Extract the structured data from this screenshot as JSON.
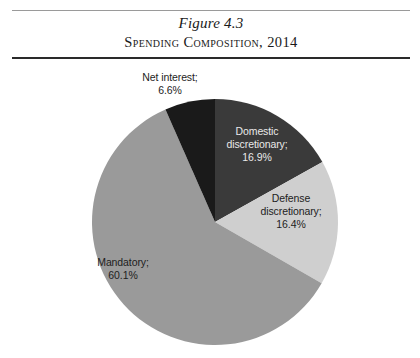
{
  "caption": {
    "figure_number": "Figure 4.3",
    "title": "Spending Composition, 2014"
  },
  "chart_data": {
    "type": "pie",
    "title": "Spending Composition, 2014",
    "xlabel": "",
    "ylabel": "",
    "legend_position": "none",
    "grid": false,
    "start_angle_deg": 0,
    "direction": "clockwise",
    "units": "percent",
    "total": 100.0,
    "categories": [
      "Domestic discretionary",
      "Defense discretionary",
      "Mandatory",
      "Net interest"
    ],
    "values": [
      16.9,
      16.4,
      60.1,
      6.6
    ],
    "colors": [
      "#3a3a3a",
      "#cfcfcf",
      "#9a9a9a",
      "#1a1a1a"
    ],
    "slices": [
      {
        "name": "Domestic discretionary",
        "value": 16.9,
        "label": "Domestic\ndiscretionary;\n16.9%",
        "color": "#3a3a3a",
        "label_color": "#e9e9e9"
      },
      {
        "name": "Defense discretionary",
        "value": 16.4,
        "label": "Defense\ndiscretionary;\n16.4%",
        "color": "#cfcfcf",
        "label_color": "#1d1d1d"
      },
      {
        "name": "Mandatory",
        "value": 60.1,
        "label": "Mandatory;\n60.1%",
        "color": "#9a9a9a",
        "label_color": "#1d1d1d"
      },
      {
        "name": "Net interest",
        "value": 6.6,
        "label": "Net interest;\n6.6%",
        "color": "#1a1a1a",
        "label_color": "#1d1d1d"
      }
    ]
  }
}
